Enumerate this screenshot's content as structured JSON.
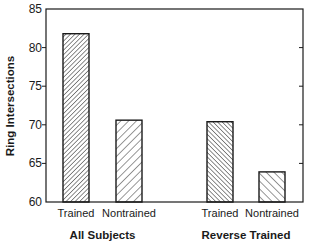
{
  "chart_data": {
    "type": "bar",
    "title": "",
    "xlabel": "",
    "ylabel": "Ring Intersections",
    "ylim": [
      60,
      85
    ],
    "yticks": [
      60,
      65,
      70,
      75,
      80,
      85
    ],
    "grid": false,
    "legend": null,
    "groups": [
      {
        "label": "All Subjects",
        "categories": [
          "Trained",
          "Nontrained"
        ]
      },
      {
        "label": "Reverse Trained",
        "categories": [
          "Trained",
          "Nontrained"
        ]
      }
    ],
    "categories": [
      "Trained",
      "Nontrained",
      "Trained",
      "Nontrained"
    ],
    "values": [
      81.8,
      70.6,
      70.4,
      63.9
    ],
    "bar_patterns": [
      "dense-forward-hatch",
      "sparse-forward-hatch",
      "dense-back-hatch",
      "sparse-back-hatch"
    ]
  },
  "colors": {
    "ink": "#1a1a1a",
    "background": "#ffffff"
  }
}
